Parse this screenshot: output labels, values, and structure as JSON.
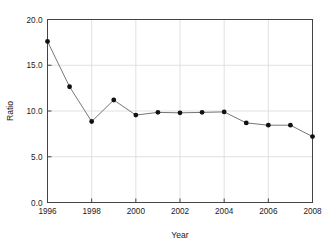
{
  "chart_data": {
    "type": "line",
    "title": "",
    "xlabel": "Year",
    "ylabel": "Ratio",
    "x": [
      1996,
      1997,
      1998,
      1999,
      2000,
      2001,
      2002,
      2003,
      2004,
      2005,
      2006,
      2007,
      2008
    ],
    "values": [
      17.6,
      12.65,
      8.85,
      11.2,
      9.55,
      9.85,
      9.8,
      9.85,
      9.9,
      8.7,
      8.45,
      8.45,
      7.2
    ],
    "series": [
      {
        "name": "Ratio",
        "values": [
          17.6,
          12.65,
          8.85,
          11.2,
          9.55,
          9.85,
          9.8,
          9.85,
          9.9,
          8.7,
          8.45,
          8.45,
          7.2
        ]
      }
    ],
    "xlim": [
      1996,
      2008
    ],
    "ylim": [
      0.0,
      20.0
    ],
    "xticks": [
      1996,
      1998,
      2000,
      2002,
      2004,
      2006,
      2008
    ],
    "xticklabels": [
      "1996",
      "1998",
      "2000",
      "2002",
      "2004",
      "2006",
      "2008"
    ],
    "yticks": [
      0.0,
      5.0,
      10.0,
      15.0,
      20.0
    ],
    "yticklabels": [
      "0.0",
      "5.0",
      "10.0",
      "15.0",
      "20.0"
    ],
    "grid": true,
    "grid_axis": "y",
    "legend": false,
    "legend_position": "none",
    "marker": "filled-circle",
    "line_color": "#666666",
    "marker_color": "#111111",
    "grid_color": "#d9d9d9",
    "frame_color": "#444444",
    "background_color": "#ffffff"
  }
}
